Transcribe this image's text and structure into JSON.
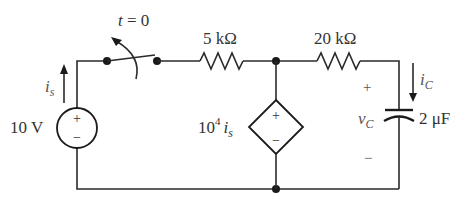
{
  "circuit": {
    "switch": {
      "label": "t = 0",
      "action": "opens"
    },
    "resistor_1": {
      "label": "5 kΩ"
    },
    "resistor_2": {
      "label": "20 kΩ"
    },
    "voltage_source": {
      "label": "10 V",
      "plus": "+",
      "minus": "−"
    },
    "dependent_source": {
      "coef": "10",
      "exp": "4",
      "var": "i",
      "sub": "s",
      "plus": "+",
      "minus": "−"
    },
    "capacitor": {
      "label": "2 μF",
      "voltage_var": "v",
      "voltage_sub": "C",
      "plus": "+",
      "minus": "−"
    },
    "current_source": {
      "var": "i",
      "sub": "s"
    },
    "current_cap": {
      "var": "i",
      "sub": "C"
    }
  },
  "colors": {
    "wire": "#2a2a2a",
    "text": "#333333",
    "background": "#ffffff"
  }
}
